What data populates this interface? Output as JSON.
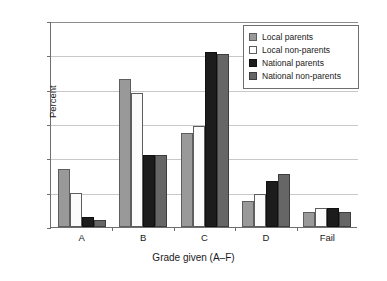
{
  "chart_data": {
    "type": "bar",
    "title": "",
    "xlabel": "Grade given (A–F)",
    "ylabel": "Percent",
    "categories": [
      "A",
      "B",
      "C",
      "D",
      "Fail"
    ],
    "series": [
      {
        "name": "Local parents",
        "color": "#999999",
        "values": [
          17,
          43,
          27.5,
          7.5,
          4.5
        ]
      },
      {
        "name": "Local non-parents",
        "color": "#ffffff",
        "values": [
          10,
          39,
          29.5,
          9.5,
          5.5
        ]
      },
      {
        "name": "National parents",
        "color": "#1c1c1c",
        "values": [
          3,
          21,
          51,
          13.5,
          5.5
        ]
      },
      {
        "name": "National non-parents",
        "color": "#666666",
        "values": [
          2,
          21,
          50.5,
          15.5,
          4.5
        ]
      }
    ],
    "ylim": [
      0,
      60
    ],
    "yticks": [
      0,
      10,
      20,
      30,
      40,
      50,
      60
    ],
    "ytick_labels": [
      "0",
      "10",
      "20",
      "30",
      "40",
      "50",
      "60"
    ],
    "grid": true,
    "grid_axis": "y",
    "legend_position": "top-right"
  }
}
